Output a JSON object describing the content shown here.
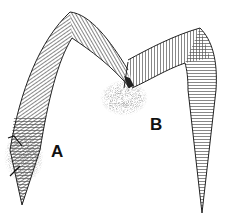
{
  "figure": {
    "labels": [
      {
        "id": "A",
        "text": "A",
        "x": 51,
        "y": 143
      },
      {
        "id": "B",
        "text": "B",
        "x": 150,
        "y": 116
      }
    ],
    "stipple_regions": [
      {
        "id": "A",
        "cx": 24,
        "cy": 157,
        "rx": 20,
        "ry": 26
      },
      {
        "id": "B",
        "cx": 124,
        "cy": 98,
        "rx": 24,
        "ry": 18
      }
    ],
    "colors": {
      "ink": "#222222",
      "hatch": "#555555",
      "stipple": "#444444",
      "background": "#ffffff"
    }
  }
}
